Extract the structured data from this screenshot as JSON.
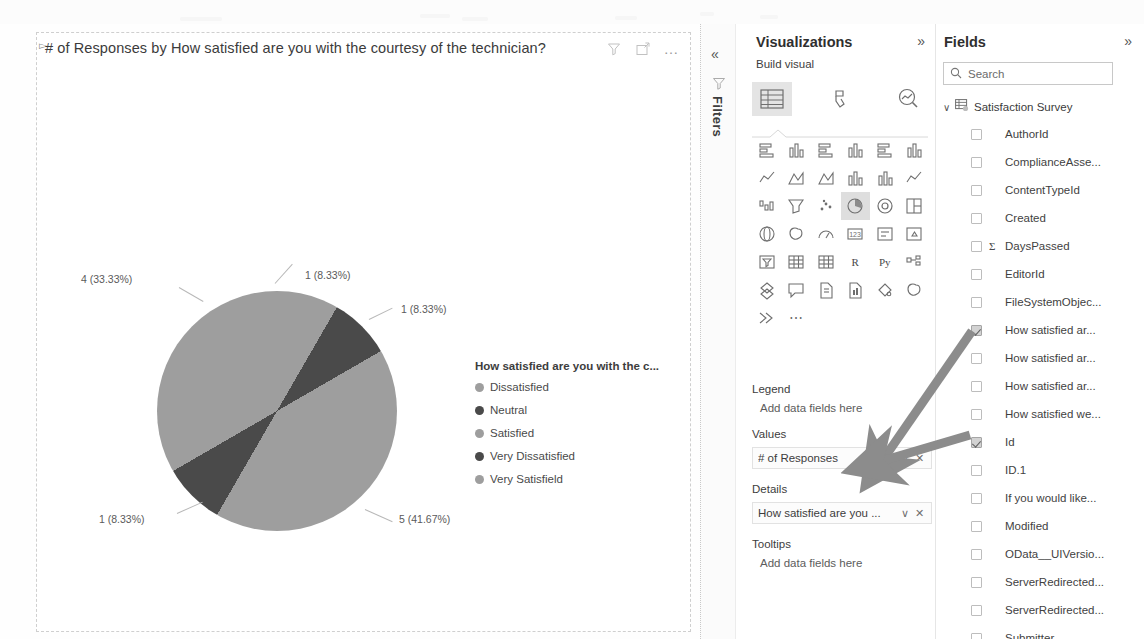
{
  "visual": {
    "title": "# of Responses by How satisfied are you with the courtesy of the technician?",
    "icons": {
      "filter": "filter-icon",
      "focus": "focus-mode-icon",
      "more": "more-options-icon"
    },
    "more_glyph": "…"
  },
  "chart_data": {
    "type": "pie",
    "title": "# of Responses by How satisfied are you with the courtesy of the technician?",
    "legend_title": "How satisfied are you with the c...",
    "legend_position": "right",
    "categories": [
      "Dissatisfied",
      "Neutral",
      "Satisfied",
      "Very Dissatisfied",
      "Very Satisfield"
    ],
    "values": [
      1,
      1,
      5,
      1,
      4
    ],
    "percents": [
      8.33,
      8.33,
      41.67,
      8.33,
      33.33
    ],
    "total": 12,
    "labels": [
      "1 (8.33%)",
      "1 (8.33%)",
      "5 (41.67%)",
      "1 (8.33%)",
      "4 (33.33%)"
    ],
    "colors": [
      "#9e9e9e",
      "#4a4a4a",
      "#9e9e9e",
      "#4a4a4a",
      "#9e9e9e"
    ],
    "legend_dot_colors": [
      "#9e9e9e",
      "#4a4a4a",
      "#9e9e9e",
      "#4a4a4a",
      "#9e9e9e"
    ]
  },
  "filters_rail": {
    "collapse_glyph": "«",
    "label": "Filters",
    "funnel_icon": "filter-icon"
  },
  "visualizations": {
    "title": "Visualizations",
    "expand_glyph": "»",
    "build_visual": "Build visual",
    "build_tabs": [
      {
        "name": "build-visual-tab",
        "icon": "fields-table-icon",
        "active": true
      },
      {
        "name": "format-visual-tab",
        "icon": "paint-roller-icon",
        "active": false
      },
      {
        "name": "analytics-tab",
        "icon": "magnifier-chart-icon",
        "active": false
      }
    ],
    "gallery": [
      {
        "icon": "stacked-bar-chart-icon",
        "selected": false
      },
      {
        "icon": "stacked-column-chart-icon",
        "selected": false
      },
      {
        "icon": "clustered-bar-chart-icon",
        "selected": false
      },
      {
        "icon": "clustered-column-chart-icon",
        "selected": false
      },
      {
        "icon": "100-stacked-bar-chart-icon",
        "selected": false
      },
      {
        "icon": "100-stacked-column-chart-icon",
        "selected": false
      },
      {
        "icon": "line-chart-icon",
        "selected": false
      },
      {
        "icon": "area-chart-icon",
        "selected": false
      },
      {
        "icon": "stacked-area-chart-icon",
        "selected": false
      },
      {
        "icon": "line-stacked-column-chart-icon",
        "selected": false
      },
      {
        "icon": "line-clustered-column-chart-icon",
        "selected": false
      },
      {
        "icon": "ribbon-chart-icon",
        "selected": false
      },
      {
        "icon": "waterfall-chart-icon",
        "selected": false
      },
      {
        "icon": "funnel-chart-icon",
        "selected": false
      },
      {
        "icon": "scatter-chart-icon",
        "selected": false
      },
      {
        "icon": "pie-chart-icon",
        "selected": true
      },
      {
        "icon": "donut-chart-icon",
        "selected": false
      },
      {
        "icon": "treemap-icon",
        "selected": false
      },
      {
        "icon": "map-icon",
        "selected": false
      },
      {
        "icon": "filled-map-icon",
        "selected": false
      },
      {
        "icon": "gauge-icon",
        "selected": false
      },
      {
        "icon": "card-icon",
        "selected": false
      },
      {
        "icon": "multi-row-card-icon",
        "selected": false
      },
      {
        "icon": "kpi-icon",
        "selected": false
      },
      {
        "icon": "slicer-icon",
        "selected": false
      },
      {
        "icon": "table-icon",
        "selected": false
      },
      {
        "icon": "matrix-icon",
        "selected": false
      },
      {
        "icon": "r-script-visual-icon",
        "label": "R",
        "selected": false
      },
      {
        "icon": "python-visual-icon",
        "label": "Py",
        "selected": false
      },
      {
        "icon": "key-influencers-icon",
        "selected": false
      },
      {
        "icon": "decomposition-tree-icon",
        "selected": false
      },
      {
        "icon": "qna-icon",
        "selected": false
      },
      {
        "icon": "smart-narrative-icon",
        "selected": false
      },
      {
        "icon": "paginated-report-icon",
        "selected": false
      },
      {
        "icon": "power-apps-icon",
        "selected": false
      },
      {
        "icon": "power-automate-icon",
        "selected": false
      },
      {
        "icon": "arrow-visual-icon",
        "selected": false
      },
      {
        "icon": "more-visuals-icon",
        "label": "⋯",
        "selected": false
      }
    ],
    "wells": [
      {
        "label": "Legend",
        "placeholder": "Add data fields here",
        "field": null
      },
      {
        "label": "Values",
        "placeholder": null,
        "field": "# of Responses"
      },
      {
        "label": "Details",
        "placeholder": null,
        "field": "How satisfied are you ..."
      },
      {
        "label": "Tooltips",
        "placeholder": "Add data fields here",
        "field": null
      }
    ],
    "chip_dropdown_glyph": "∨",
    "chip_remove_glyph": "✕"
  },
  "fields": {
    "title": "Fields",
    "expand_glyph": "»",
    "search": {
      "placeholder": "Search",
      "icon": "search-icon"
    },
    "table": {
      "name": "Satisfaction Survey",
      "expanded": true,
      "chevron": "∨",
      "icon": "table-icon"
    },
    "items": [
      {
        "name": "AuthorId",
        "checked": false,
        "measure": false
      },
      {
        "name": "ComplianceAsse...",
        "checked": false,
        "measure": false
      },
      {
        "name": "ContentTypeId",
        "checked": false,
        "measure": false
      },
      {
        "name": "Created",
        "checked": false,
        "measure": false
      },
      {
        "name": "DaysPassed",
        "checked": false,
        "measure": true
      },
      {
        "name": "EditorId",
        "checked": false,
        "measure": false
      },
      {
        "name": "FileSystemObjec...",
        "checked": false,
        "measure": false
      },
      {
        "name": "How satisfied ar...",
        "checked": true,
        "measure": false
      },
      {
        "name": "How satisfied ar...",
        "checked": false,
        "measure": false
      },
      {
        "name": "How satisfied ar...",
        "checked": false,
        "measure": false
      },
      {
        "name": "How satisfied we...",
        "checked": false,
        "measure": false
      },
      {
        "name": "Id",
        "checked": true,
        "measure": false
      },
      {
        "name": "ID.1",
        "checked": false,
        "measure": false
      },
      {
        "name": "If you would like...",
        "checked": false,
        "measure": false
      },
      {
        "name": "Modified",
        "checked": false,
        "measure": false
      },
      {
        "name": "OData__UIVersio...",
        "checked": false,
        "measure": false
      },
      {
        "name": "ServerRedirected...",
        "checked": false,
        "measure": false
      },
      {
        "name": "ServerRedirected...",
        "checked": false,
        "measure": false
      },
      {
        "name": "Submitter",
        "checked": false,
        "measure": false
      }
    ]
  },
  "annotations": {
    "arrow_color": "#8c8c8c",
    "arrows": [
      {
        "name": "arrow-to-values-well",
        "from": "Id field checkbox",
        "to": "# of Responses chip"
      },
      {
        "name": "arrow-to-details-well",
        "from": "How satisfied ar... field checkbox",
        "to": "How satisfied are you ... chip"
      }
    ]
  }
}
